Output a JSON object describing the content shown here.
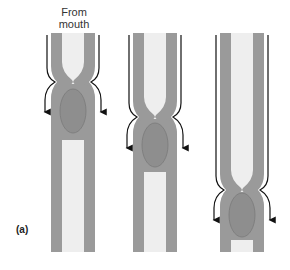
{
  "labels": {
    "from_line1": "From",
    "from_line2": "mouth",
    "panel": "(a)"
  },
  "colors": {
    "wall": "#9a9a9a",
    "lumen": "#eeeeee",
    "bolus": "#8e8e8e",
    "bolus_outline": "#7a7a7a",
    "arrow": "#111111",
    "background": "#ffffff"
  },
  "stages": [
    {
      "id": "stage-1",
      "x_left": 51,
      "x_right": 95,
      "constriction_y": 82,
      "bolus_cy": 111,
      "top": 33,
      "bottom": 252
    },
    {
      "id": "stage-2",
      "x_left": 133,
      "x_right": 177,
      "constriction_y": 117,
      "bolus_cy": 145,
      "top": 33,
      "bottom": 252
    },
    {
      "id": "stage-3",
      "x_left": 220,
      "x_right": 264,
      "constriction_y": 190,
      "bolus_cy": 215,
      "top": 33,
      "bottom": 252
    }
  ]
}
